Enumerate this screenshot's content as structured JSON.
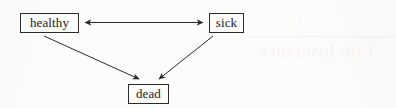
{
  "page": {
    "background_color": "#fdfdfc",
    "ink_color": "#1c1c1c",
    "width": 396,
    "height": 108
  },
  "diagram": {
    "type": "state-transition-diagram",
    "nodes": [
      {
        "id": "healthy",
        "label": "healthy",
        "x": 20,
        "y": 13,
        "width": 59,
        "height": 20
      },
      {
        "id": "sick",
        "label": "sick",
        "x": 209,
        "y": 13,
        "width": 35,
        "height": 20
      },
      {
        "id": "dead",
        "label": "dead",
        "x": 128,
        "y": 84,
        "width": 41,
        "height": 20
      }
    ],
    "edges": [
      {
        "id": "healthy-sick",
        "from": "healthy",
        "to": "sick",
        "direction": "bidirectional",
        "style": "straight"
      },
      {
        "id": "healthy-dead",
        "from": "healthy",
        "to": "dead",
        "direction": "forward",
        "style": "straight"
      },
      {
        "id": "sick-dead",
        "from": "sick",
        "to": "dead",
        "direction": "forward",
        "style": "straight"
      }
    ]
  },
  "watermark": {
    "heading": "Life Insurance",
    "subline": "Chapter",
    "note": "mirrored bleed-through from reverse of page"
  }
}
